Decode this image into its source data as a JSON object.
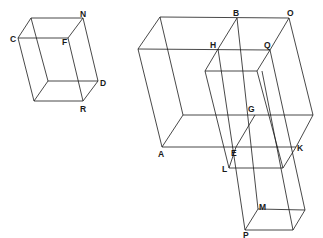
{
  "diagram": {
    "type": "isometric-box-drawing",
    "small_box": {
      "labels": [
        {
          "text": "N",
          "x": 80,
          "y": 17
        },
        {
          "text": "C",
          "x": 10,
          "y": 42
        },
        {
          "text": "F",
          "x": 62,
          "y": 45
        },
        {
          "text": "D",
          "x": 100,
          "y": 86
        },
        {
          "text": "R",
          "x": 80,
          "y": 112
        }
      ]
    },
    "large_figure": {
      "labels": [
        {
          "text": "B",
          "x": 233,
          "y": 16
        },
        {
          "text": "O",
          "x": 287,
          "y": 16
        },
        {
          "text": "H",
          "x": 210,
          "y": 48
        },
        {
          "text": "Q",
          "x": 264,
          "y": 48
        },
        {
          "text": "G",
          "x": 248,
          "y": 112
        },
        {
          "text": "A",
          "x": 158,
          "y": 157
        },
        {
          "text": "E",
          "x": 231,
          "y": 156
        },
        {
          "text": "K",
          "x": 297,
          "y": 151
        },
        {
          "text": "L",
          "x": 222,
          "y": 172
        },
        {
          "text": "M",
          "x": 259,
          "y": 210
        },
        {
          "text": "P",
          "x": 243,
          "y": 238
        }
      ]
    },
    "line_color": "#1a1a1a",
    "background": "#ffffff"
  }
}
